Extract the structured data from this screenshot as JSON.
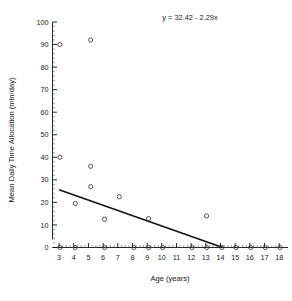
{
  "chart_data": {
    "type": "scatter",
    "title": "",
    "annotation": "y = 32.42 - 2.29x",
    "xlabel": "Age  (years)",
    "ylabel": "Mean Daily Time Allocation (min/day)",
    "xlim": [
      2.55,
      18.6
    ],
    "ylim": [
      0,
      100
    ],
    "xticks": [
      3,
      4,
      5,
      6,
      7,
      8,
      9,
      10,
      11,
      12,
      13,
      14,
      15,
      16,
      17,
      18
    ],
    "yticks": [
      0,
      10,
      20,
      30,
      40,
      50,
      60,
      70,
      80,
      90,
      100
    ],
    "xtick_labels": [
      "3",
      "4",
      "5",
      "6",
      "7",
      "8",
      "9",
      "10",
      "11",
      "12",
      "13",
      "14",
      "15",
      "16",
      "17",
      "18"
    ],
    "ytick_labels": [
      "0",
      "10",
      "20",
      "30",
      "40",
      "50",
      "60",
      "70",
      "80",
      "90",
      "100"
    ],
    "x_minor_ticks_per_interval": 4,
    "y_minor_ticks_per_interval": 5,
    "grid": false,
    "legend": null,
    "marker": "open-circle",
    "points": [
      {
        "x": 3.05,
        "y": 90
      },
      {
        "x": 3.05,
        "y": 40
      },
      {
        "x": 3.05,
        "y": 0
      },
      {
        "x": 4.1,
        "y": 19.5
      },
      {
        "x": 4.1,
        "y": 0
      },
      {
        "x": 5.15,
        "y": 92
      },
      {
        "x": 5.15,
        "y": 36
      },
      {
        "x": 5.15,
        "y": 27
      },
      {
        "x": 6.1,
        "y": 12.5
      },
      {
        "x": 6.1,
        "y": 0
      },
      {
        "x": 7.1,
        "y": 22.5
      },
      {
        "x": 8.1,
        "y": 0
      },
      {
        "x": 9.1,
        "y": 12.8
      },
      {
        "x": 9.1,
        "y": 0
      },
      {
        "x": 10.05,
        "y": 0
      },
      {
        "x": 12.05,
        "y": 0
      },
      {
        "x": 13.05,
        "y": 14
      },
      {
        "x": 13.05,
        "y": 0
      },
      {
        "x": 14.1,
        "y": 0
      },
      {
        "x": 15.05,
        "y": 0
      },
      {
        "x": 16.05,
        "y": 0
      },
      {
        "x": 17.05,
        "y": 0
      },
      {
        "x": 18.05,
        "y": 0
      }
    ],
    "fit_line": {
      "equation": "y = 32.42 - 2.29x",
      "intercept": 32.42,
      "slope": -2.29,
      "x_start": 3.0,
      "y_start": 25.6,
      "x_end": 14.15,
      "y_end": 0
    }
  }
}
